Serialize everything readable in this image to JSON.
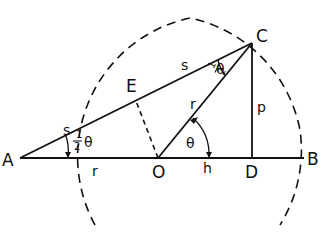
{
  "diagram": {
    "points": {
      "A": {
        "label": "A",
        "x": 20,
        "y": 158
      },
      "E": {
        "label": "E",
        "x": 135,
        "y": 99
      },
      "O": {
        "label": "O",
        "x": 158,
        "y": 158
      },
      "C": {
        "label": "C",
        "x": 252,
        "y": 43
      },
      "D": {
        "label": "D",
        "x": 253,
        "y": 158
      },
      "B": {
        "label": "B",
        "x": 304,
        "y": 158
      }
    },
    "segment_labels": {
      "s_upper": "s",
      "s_lower": "s",
      "r_base": "r",
      "r_radius": "r",
      "p": "p",
      "h": "h",
      "theta": "θ",
      "half_num": "1",
      "half_den": "2",
      "half_theta_theta": "θ",
      "half_theta_c_theta": "θ"
    },
    "colors": {
      "ink": "#111111",
      "background": "#ffffff"
    }
  }
}
